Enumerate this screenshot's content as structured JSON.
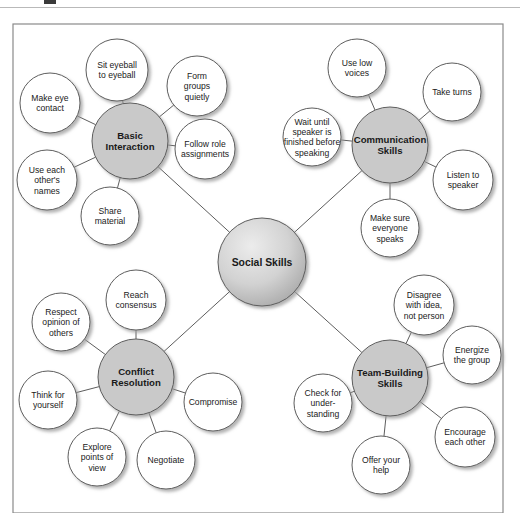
{
  "figure": {
    "frame": {
      "x": 13,
      "y": 24,
      "width": 490,
      "height": 489
    },
    "canvas": {
      "width": 520,
      "height": 513
    }
  },
  "colors": {
    "hub_fill": "#c9c9c9",
    "leaf_fill": "#ffffff",
    "stroke": "#5d5d5d",
    "text": "#1a1a1a",
    "frame_stroke": "#8a8a8a",
    "shadow": "#bbbbbb",
    "center_gradient_light": "#e8e8e8",
    "center_gradient_dark": "#a8a8a8",
    "background": "#ffffff"
  },
  "center": {
    "id": "social-skills",
    "label": "Social Skills",
    "cx": 262,
    "cy": 262,
    "r": 44
  },
  "branches": [
    {
      "id": "basic-interaction",
      "label": "Basic Interaction",
      "lines": [
        "Basic",
        "Interaction"
      ],
      "cx": 130,
      "cy": 141,
      "r": 38,
      "leaves": [
        {
          "id": "sit-eyeball-to-eyeball",
          "lines": [
            "Sit eyeball",
            "to eyeball"
          ],
          "cx": 117,
          "cy": 70,
          "r": 31
        },
        {
          "id": "form-groups-quietly",
          "lines": [
            "Form",
            "groups",
            "quietly"
          ],
          "cx": 197,
          "cy": 86,
          "r": 30
        },
        {
          "id": "follow-role-assignments",
          "lines": [
            "Follow role",
            "assignments"
          ],
          "cx": 205,
          "cy": 149,
          "r": 30
        },
        {
          "id": "share-material",
          "lines": [
            "Share",
            "material"
          ],
          "cx": 110,
          "cy": 216,
          "r": 29
        },
        {
          "id": "use-each-others-names",
          "lines": [
            "Use each",
            "other's",
            "names"
          ],
          "cx": 47,
          "cy": 180,
          "r": 30
        },
        {
          "id": "make-eye-contact",
          "lines": [
            "Make eye",
            "contact"
          ],
          "cx": 50,
          "cy": 103,
          "r": 30
        }
      ]
    },
    {
      "id": "communication-skills",
      "label": "Communication Skills",
      "lines": [
        "Communication",
        "Skills"
      ],
      "cx": 390,
      "cy": 145,
      "r": 38,
      "leaves": [
        {
          "id": "use-low-voices",
          "lines": [
            "Use low",
            "voices"
          ],
          "cx": 357,
          "cy": 68,
          "r": 29
        },
        {
          "id": "take-turns",
          "lines": [
            "Take turns"
          ],
          "cx": 452,
          "cy": 92,
          "r": 29
        },
        {
          "id": "listen-to-speaker",
          "lines": [
            "Listen to",
            "speaker"
          ],
          "cx": 463,
          "cy": 180,
          "r": 30
        },
        {
          "id": "make-sure-everyone-speaks",
          "lines": [
            "Make sure",
            "everyone",
            "speaks"
          ],
          "cx": 390,
          "cy": 228,
          "r": 29
        },
        {
          "id": "wait-until-speaker-finished",
          "lines": [
            "Wait until",
            "speaker is",
            "finished before",
            "speaking"
          ],
          "cx": 312,
          "cy": 137,
          "r": 29
        }
      ]
    },
    {
      "id": "conflict-resolution",
      "label": "Conflict Resolution",
      "lines": [
        "Conflict",
        "Resolution"
      ],
      "cx": 136,
      "cy": 377,
      "r": 38,
      "leaves": [
        {
          "id": "reach-consensus",
          "lines": [
            "Reach",
            "consensus"
          ],
          "cx": 136,
          "cy": 300,
          "r": 30
        },
        {
          "id": "compromise",
          "lines": [
            "Compromise"
          ],
          "cx": 213,
          "cy": 402,
          "r": 29
        },
        {
          "id": "negotiate",
          "lines": [
            "Negotiate"
          ],
          "cx": 166,
          "cy": 460,
          "r": 29
        },
        {
          "id": "explore-points-of-view",
          "lines": [
            "Explore",
            "points of",
            "view"
          ],
          "cx": 97,
          "cy": 457,
          "r": 29
        },
        {
          "id": "think-for-yourself",
          "lines": [
            "Think for",
            "yourself"
          ],
          "cx": 48,
          "cy": 400,
          "r": 29
        },
        {
          "id": "respect-opinion-of-others",
          "lines": [
            "Respect",
            "opinion of",
            "others"
          ],
          "cx": 61,
          "cy": 322,
          "r": 29
        }
      ]
    },
    {
      "id": "team-building-skills",
      "label": "Team-Building Skills",
      "lines": [
        "Team-Building",
        "Skills"
      ],
      "cx": 390,
      "cy": 378,
      "r": 38,
      "leaves": [
        {
          "id": "disagree-with-idea-not-person",
          "lines": [
            "Disagree",
            "with idea,",
            "not person"
          ],
          "cx": 424,
          "cy": 305,
          "r": 30
        },
        {
          "id": "energize-the-group",
          "lines": [
            "Energize",
            "the group"
          ],
          "cx": 472,
          "cy": 355,
          "r": 29
        },
        {
          "id": "encourage-each-other",
          "lines": [
            "Encourage",
            "each other"
          ],
          "cx": 465,
          "cy": 437,
          "r": 30
        },
        {
          "id": "offer-your-help",
          "lines": [
            "Offer your",
            "help"
          ],
          "cx": 381,
          "cy": 465,
          "r": 29
        },
        {
          "id": "check-for-understanding",
          "lines": [
            "Check for",
            "under-",
            "standing"
          ],
          "cx": 323,
          "cy": 403,
          "r": 29
        }
      ]
    }
  ]
}
